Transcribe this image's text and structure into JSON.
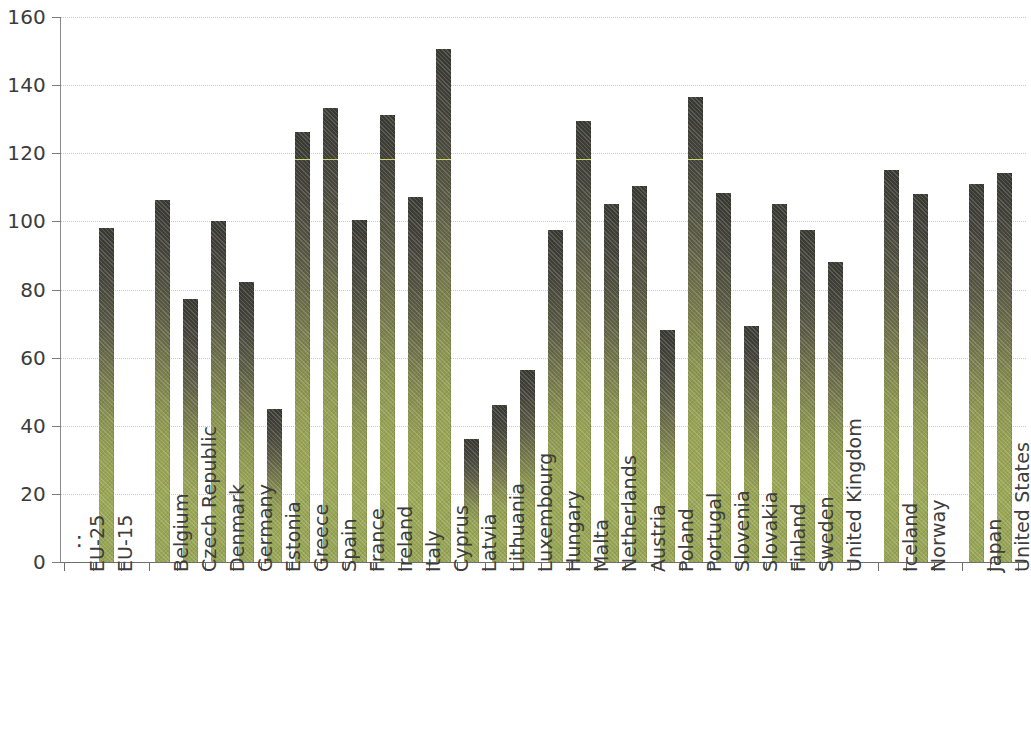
{
  "chart_data": {
    "type": "bar",
    "title": "",
    "subtitle": "",
    "xlabel": "",
    "ylabel": "",
    "ylim": [
      0,
      160
    ],
    "yticks": [
      0,
      20,
      40,
      60,
      80,
      100,
      120,
      140,
      160
    ],
    "grid": true,
    "legend": null,
    "bar_color_top": "#3a3a34",
    "bar_color_bottom": "#99a655",
    "highlight_line_color": "#d7e36a",
    "missing_value_symbol": ":",
    "categories": [
      "EU-25",
      "EU-15",
      "",
      "Belgium",
      "Czech Republic",
      "Denmark",
      "Germany",
      "Estonia",
      "Greece",
      "Spain",
      "France",
      "Ireland",
      "Italy",
      "Cyprus",
      "Latvia",
      "Lithuania",
      "Luxembourg",
      "Hungary",
      "Malta",
      "Netherlands",
      "Austria",
      "Poland",
      "Portugal",
      "Slovenia",
      "Slovakia",
      "Finland",
      "Sweden",
      "United Kingdom",
      "",
      "Iceland",
      "Norway",
      "",
      "Japan",
      "United States"
    ],
    "values": [
      null,
      98.2,
      null,
      106.4,
      77.3,
      100.2,
      82.2,
      45.0,
      126.3,
      133.3,
      100.3,
      131.3,
      107.1,
      150.5,
      36.1,
      46.1,
      56.4,
      97.4,
      129.4,
      105.0,
      110.3,
      68.2,
      136.4,
      108.2,
      69.2,
      105.0,
      97.4,
      88.2,
      null,
      115.2,
      108.0,
      null,
      111.0,
      114.2
    ]
  },
  "yaxis": {
    "ticks": [
      "0",
      "20",
      "40",
      "60",
      "80",
      "100",
      "120",
      "140",
      "160"
    ]
  }
}
